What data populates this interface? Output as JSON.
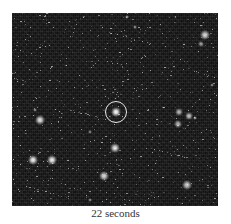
{
  "figure": {
    "caption": "22 seconds",
    "frame": {
      "x": 12,
      "y": 13,
      "width": 206,
      "height": 193
    },
    "marker": {
      "x": 116,
      "y": 112,
      "radius": 11,
      "label": "circled-target-star"
    },
    "stars": [
      {
        "x": 116,
        "y": 112,
        "size": 5,
        "brightness": 1.0
      },
      {
        "x": 40,
        "y": 120,
        "size": 5,
        "brightness": 0.9
      },
      {
        "x": 33,
        "y": 160,
        "size": 5,
        "brightness": 0.95
      },
      {
        "x": 52,
        "y": 160,
        "size": 5,
        "brightness": 0.95
      },
      {
        "x": 115,
        "y": 148,
        "size": 5,
        "brightness": 0.9
      },
      {
        "x": 104,
        "y": 176,
        "size": 5,
        "brightness": 0.85
      },
      {
        "x": 187,
        "y": 185,
        "size": 5,
        "brightness": 0.8
      },
      {
        "x": 205,
        "y": 35,
        "size": 5,
        "brightness": 0.85
      },
      {
        "x": 201,
        "y": 44,
        "size": 3,
        "brightness": 0.6
      },
      {
        "x": 179,
        "y": 112,
        "size": 4,
        "brightness": 0.7
      },
      {
        "x": 189,
        "y": 116,
        "size": 4,
        "brightness": 0.75
      },
      {
        "x": 178,
        "y": 124,
        "size": 4,
        "brightness": 0.7
      },
      {
        "x": 195,
        "y": 118,
        "size": 2,
        "brightness": 0.6
      },
      {
        "x": 127,
        "y": 17,
        "size": 2,
        "brightness": 0.6
      },
      {
        "x": 135,
        "y": 27,
        "size": 2,
        "brightness": 0.55
      },
      {
        "x": 35,
        "y": 110,
        "size": 2,
        "brightness": 0.5
      },
      {
        "x": 90,
        "y": 132,
        "size": 2,
        "brightness": 0.5
      },
      {
        "x": 212,
        "y": 85,
        "size": 2,
        "brightness": 0.5
      },
      {
        "x": 90,
        "y": 200,
        "size": 2,
        "brightness": 0.5
      }
    ]
  }
}
